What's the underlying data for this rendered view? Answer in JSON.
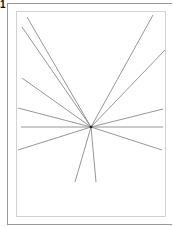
{
  "figure": {
    "label": "1",
    "center": [
      91,
      127
    ],
    "line_color": "#8a8a8a",
    "frame_color": "#9a9a9a",
    "outer_frame": {
      "x": 7,
      "y": 3,
      "w": 170,
      "h": 221
    },
    "inner_frame": {
      "x": 16,
      "y": 11,
      "w": 149,
      "h": 205
    },
    "rays": [
      {
        "x": 27,
        "y": 17
      },
      {
        "x": 22,
        "y": 27
      },
      {
        "x": 22,
        "y": 78
      },
      {
        "x": 18,
        "y": 108
      },
      {
        "x": 21,
        "y": 127
      },
      {
        "x": 18,
        "y": 150
      },
      {
        "x": 75,
        "y": 182
      },
      {
        "x": 96,
        "y": 182
      },
      {
        "x": 162,
        "y": 150
      },
      {
        "x": 163,
        "y": 127
      },
      {
        "x": 163,
        "y": 109
      },
      {
        "x": 165,
        "y": 50
      },
      {
        "x": 153,
        "y": 15
      }
    ]
  }
}
